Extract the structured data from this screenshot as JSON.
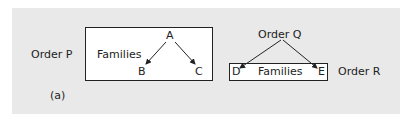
{
  "diagram": {
    "left": {
      "order_label": "Order P",
      "box_label": "Families",
      "nodes": {
        "root": "A",
        "left": "B",
        "right": "C"
      }
    },
    "right": {
      "order_top_label": "Order Q",
      "order_side_label": "Order R",
      "box_label": "Families",
      "nodes": {
        "left": "D",
        "right": "E"
      }
    },
    "caption": "(a)"
  }
}
